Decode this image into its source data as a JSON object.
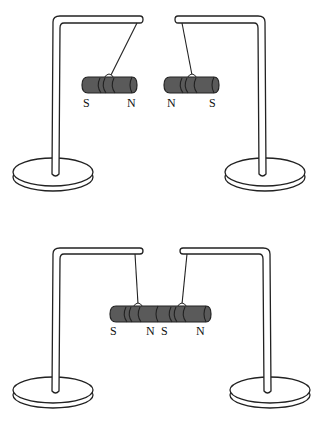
{
  "diagram": {
    "type": "physics-illustration",
    "colors": {
      "magnet": "#5a5a5a",
      "outline": "#222222",
      "background": "#ffffff"
    },
    "top_scene": {
      "description": "Two separate magnets hanging apart",
      "left_magnet": {
        "left_pole": "S",
        "right_pole": "N"
      },
      "right_magnet": {
        "left_pole": "N",
        "right_pole": "S"
      }
    },
    "bottom_scene": {
      "description": "Magnets joined end to end",
      "combined_labels": [
        "S",
        "N",
        "S",
        "N"
      ]
    }
  }
}
